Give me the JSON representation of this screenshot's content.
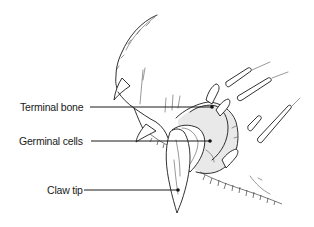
{
  "diagram": {
    "labels": [
      {
        "id": "terminal-bone",
        "text": "Terminal bone",
        "label_x": 20,
        "label_y": 101,
        "line_y": 107,
        "line_start_x": 90,
        "point_x": 212
      },
      {
        "id": "germinal-cells",
        "text": "Germinal cells",
        "label_x": 19,
        "label_y": 135,
        "line_y": 141,
        "line_start_x": 91,
        "point_x": 210
      },
      {
        "id": "claw-tip",
        "text": "Claw tip",
        "label_x": 47,
        "label_y": 184,
        "line_y": 190,
        "line_start_x": 84,
        "point_x": 178
      }
    ],
    "colors": {
      "ink": "#1a1a1a",
      "background": "#ffffff"
    }
  }
}
